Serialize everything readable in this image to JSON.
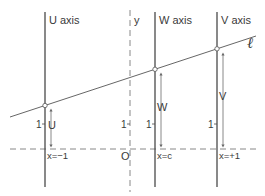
{
  "diagram": {
    "type": "nomogram",
    "colors": {
      "axis": "#4a4a4a",
      "dashed": "#7a7a7a",
      "line": "#555555",
      "arrow": "#6a6a6a",
      "text": "#3a3a3a"
    },
    "axes": [
      {
        "id": "u",
        "title": "U axis",
        "value_label": "U",
        "tick_label": "1",
        "x_label": "x=−1"
      },
      {
        "id": "w",
        "title": "W axis",
        "value_label": "W",
        "tick_label": "1",
        "x_label": "x=c"
      },
      {
        "id": "v",
        "title": "V axis",
        "value_label": "V",
        "tick_label": "1",
        "x_label": "x=+1"
      }
    ],
    "y_axis": {
      "title": "y",
      "tick_label": "1",
      "origin_label": "O"
    },
    "line_label": "ℓ"
  }
}
